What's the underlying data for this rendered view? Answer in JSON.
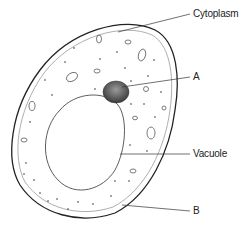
{
  "diagram": {
    "type": "plant-cell",
    "labels": {
      "cytoplasm": "Cytoplasm",
      "a": "A",
      "vacuole": "Vacuole",
      "b": "B"
    },
    "colors": {
      "outline": "#222222",
      "inner_membrane": "#888888",
      "nucleus": "#555555"
    }
  }
}
